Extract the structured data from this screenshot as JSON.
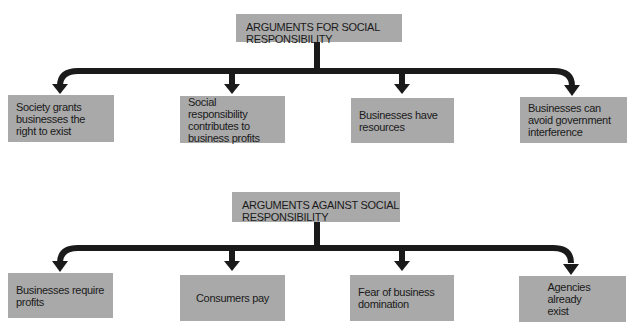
{
  "diagrams": [
    {
      "title": "ARGUMENTS FOR SOCIAL RESPONSIBILITY",
      "title_line1": "ARGUMENTS FOR SOCIAL",
      "title_line2": "RESPONSIBILITY",
      "items": [
        {
          "label": "Society grants businesses the right to exist"
        },
        {
          "label": "Social responsibility contributes to business profits"
        },
        {
          "label": "Businesses have resources"
        },
        {
          "label": "Businesses can avoid government interference"
        }
      ]
    },
    {
      "title": "ARGUMENTS AGAINST SOCIAL RESPONSIBILITY",
      "title_line1": "ARGUMENTS AGAINST SOCIAL",
      "title_line2": "RESPONSIBILITY",
      "items": [
        {
          "label": "Businesses require profits"
        },
        {
          "label": "Consumers pay"
        },
        {
          "label": "Fear of business domination"
        },
        {
          "label": "Agencies already exist"
        }
      ]
    }
  ],
  "colors": {
    "box_fill": "#a9a9a9",
    "connector": "#1a1a1a"
  }
}
